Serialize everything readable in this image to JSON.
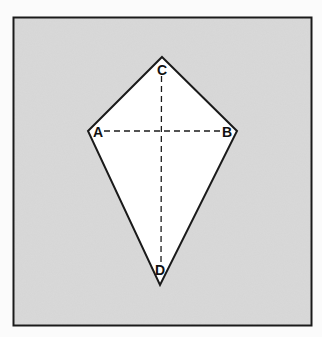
{
  "figure": {
    "background_color": "#fbfbfb",
    "panel_color": "#d9d9d9",
    "shape_fill": "#ffffff",
    "stroke_color": "#1a1a1a",
    "shape": "kite",
    "vertices": {
      "A": {
        "label": "A",
        "x": 88,
        "y": 131
      },
      "B": {
        "label": "B",
        "x": 237,
        "y": 131
      },
      "C": {
        "label": "C",
        "x": 162,
        "y": 57
      },
      "D": {
        "label": "D",
        "x": 160,
        "y": 285
      }
    },
    "diagonals": [
      "AB",
      "CD"
    ],
    "diagonal_style": "dashed"
  }
}
